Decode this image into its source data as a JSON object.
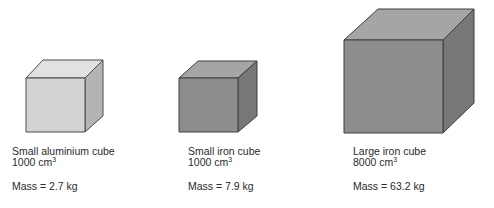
{
  "cubes": [
    {
      "name": "Small aluminium cube",
      "volume_value": "1000",
      "volume_unit": "cm",
      "volume_exp": "3",
      "mass_label": "Mass = 2.7 kg",
      "colors": {
        "front": "#d4d4d4",
        "top": "#e0e0e0",
        "side": "#b4b4b4"
      }
    },
    {
      "name": "Small iron cube",
      "volume_value": "1000",
      "volume_unit": "cm",
      "volume_exp": "3",
      "mass_label": "Mass = 7.9 kg",
      "colors": {
        "front": "#8e8e8e",
        "top": "#a6a6a6",
        "side": "#777777"
      }
    },
    {
      "name": "Large iron cube",
      "volume_value": "8000",
      "volume_unit": "cm",
      "volume_exp": "3",
      "mass_label": "Mass = 63.2 kg",
      "colors": {
        "front": "#8e8e8e",
        "top": "#a6a6a6",
        "side": "#777777"
      }
    }
  ]
}
